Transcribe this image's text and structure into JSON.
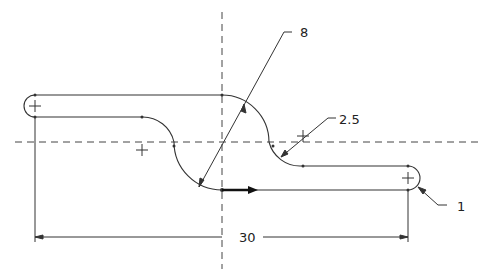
{
  "drawing": {
    "type": "slot path sketch with dimensions",
    "colors": {
      "line": "#333333",
      "centerline": "#444444",
      "background": "#ffffff"
    },
    "annotations": {
      "radius_large": "8",
      "radius_small": "2.5",
      "radius_end": "1",
      "length": "30"
    },
    "centerlines": [
      "vertical",
      "horizontal"
    ],
    "direction_arrow": "path-direction-arrow"
  }
}
